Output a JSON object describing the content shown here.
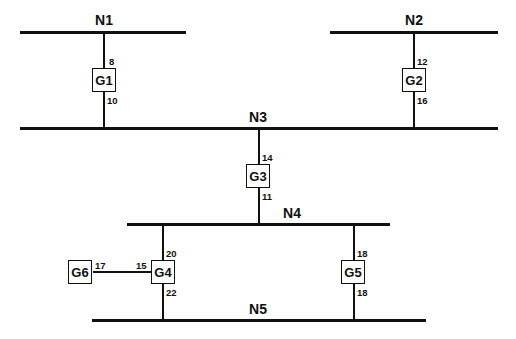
{
  "buses": [
    {
      "id": "N1",
      "label": "N1"
    },
    {
      "id": "N2",
      "label": "N2"
    },
    {
      "id": "N3",
      "label": "N3"
    },
    {
      "id": "N4",
      "label": "N4"
    },
    {
      "id": "N5",
      "label": "N5"
    }
  ],
  "nodes": [
    {
      "id": "G1",
      "label": "G1",
      "ports": {
        "top": "8",
        "bottom": "10"
      }
    },
    {
      "id": "G2",
      "label": "G2",
      "ports": {
        "top": "12",
        "bottom": "16"
      }
    },
    {
      "id": "G3",
      "label": "G3",
      "ports": {
        "top": "14",
        "bottom": "11"
      }
    },
    {
      "id": "G4",
      "label": "G4",
      "ports": {
        "top": "20",
        "bottom": "22",
        "left": "15"
      }
    },
    {
      "id": "G5",
      "label": "G5",
      "ports": {
        "top": "18",
        "bottom": "18"
      }
    },
    {
      "id": "G6",
      "label": "G6",
      "ports": {
        "right": "17"
      }
    }
  ],
  "connections": [
    {
      "from": "N1",
      "to": "G1",
      "port": "8"
    },
    {
      "from": "G1",
      "to": "N3",
      "port": "10"
    },
    {
      "from": "N2",
      "to": "G2",
      "port": "12"
    },
    {
      "from": "G2",
      "to": "N3",
      "port": "16"
    },
    {
      "from": "N3",
      "to": "G3",
      "port": "14"
    },
    {
      "from": "G3",
      "to": "N4",
      "port": "11"
    },
    {
      "from": "N4",
      "to": "G4",
      "port": "20"
    },
    {
      "from": "G4",
      "to": "N5",
      "port": "22"
    },
    {
      "from": "N4",
      "to": "G5",
      "port": "18"
    },
    {
      "from": "G5",
      "to": "N5",
      "port": "18"
    },
    {
      "from": "G6",
      "to": "G4",
      "ports": [
        "17",
        "15"
      ]
    }
  ]
}
